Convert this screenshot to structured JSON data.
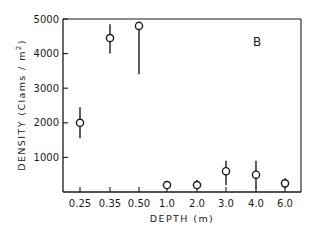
{
  "chart_data": {
    "type": "scatter",
    "title": "",
    "panel_label": "B",
    "xlabel": "DEPTH (m)",
    "ylabel": "DENSITY (Clams / m2)",
    "ylabel_parts": {
      "main": "DENSITY (Clams / m",
      "sup": "2",
      "close": ")"
    },
    "categories": [
      "0.25",
      "0.35",
      "0.50",
      "1.0",
      "2.0",
      "3.0",
      "4.0",
      "6.0"
    ],
    "yticks": [
      1000,
      2000,
      3000,
      4000,
      5000
    ],
    "ytick_labels": [
      "1000",
      "2000",
      "3000",
      "4000",
      "5000"
    ],
    "ylim": [
      0,
      5000
    ],
    "grid": false,
    "legend": null,
    "series": [
      {
        "name": "Density",
        "marker": "open-circle",
        "values": [
          2000,
          4450,
          4800,
          200,
          200,
          600,
          500,
          250
        ],
        "error_low": [
          1550,
          4000,
          3400,
          200,
          100,
          200,
          100,
          100
        ],
        "error_high": [
          2450,
          4850,
          4800,
          200,
          350,
          900,
          900,
          400
        ]
      }
    ]
  },
  "colors": {
    "ink": "#1a1a1a",
    "background": "#ffffff"
  }
}
